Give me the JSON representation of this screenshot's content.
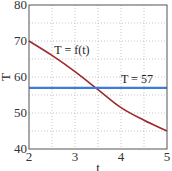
{
  "chart_data": {
    "type": "line",
    "title": "",
    "xlabel": "t",
    "ylabel": "T",
    "xlim": [
      2,
      5
    ],
    "ylim": [
      40,
      80
    ],
    "xticks": [
      2,
      3,
      4,
      5
    ],
    "yticks": [
      40,
      50,
      60,
      70,
      80
    ],
    "grid": true,
    "minor_grid": true,
    "series": [
      {
        "name": "T = f(t)",
        "color": "#9e2a2b",
        "x": [
          2.0,
          2.5,
          3.0,
          3.5,
          4.0,
          4.5,
          5.0
        ],
        "values": [
          70.0,
          66.0,
          61.5,
          56.5,
          51.5,
          48.0,
          45.0
        ]
      },
      {
        "name": "T = 57",
        "color": "#3b7dd8",
        "x": [
          2,
          5
        ],
        "values": [
          57,
          57
        ]
      }
    ],
    "annotations": [
      {
        "text": "T = f(t)",
        "x": 2.55,
        "y": 66.5
      },
      {
        "text": "T = 57",
        "x": 4.0,
        "y": 58.3
      }
    ]
  }
}
